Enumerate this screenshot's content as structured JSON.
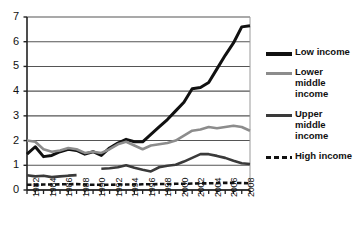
{
  "chart_data": {
    "type": "line",
    "title": "",
    "xlabel": "",
    "ylabel": "",
    "xlim": [
      1982,
      2009
    ],
    "ylim": [
      0,
      7
    ],
    "yticks": [
      0,
      1,
      2,
      3,
      4,
      5,
      6,
      7
    ],
    "xticks": [
      1982,
      1983,
      1984,
      1985,
      1986,
      1987,
      1988,
      1989,
      1990,
      1991,
      1992,
      1993,
      1994,
      1995,
      1996,
      1997,
      1998,
      1999,
      2000,
      2001,
      2002,
      2003,
      2004,
      2005,
      2006,
      2007,
      2008,
      2009
    ],
    "xtick_labels": [
      "1982",
      "1984",
      "1986",
      "1988",
      "1990",
      "1992",
      "1994",
      "1996",
      "1998",
      "2000",
      "2002",
      "2004",
      "2006",
      "2008"
    ],
    "xtick_label_years": [
      1982,
      1984,
      1986,
      1988,
      1990,
      1992,
      1994,
      1996,
      1998,
      2000,
      2002,
      2004,
      2006,
      2008
    ],
    "grid": "horizontal",
    "legend_position": "right",
    "series": [
      {
        "name": "Low income",
        "color": "#111111",
        "width": 3.0,
        "dash": "none",
        "x": [
          1982,
          1983,
          1984,
          1985,
          1986,
          1987,
          1988,
          1989,
          1990,
          1991,
          1992,
          1993,
          1994,
          1995,
          1996,
          1997,
          1998,
          1999,
          2000,
          2001,
          2002,
          2003,
          2004,
          2005,
          2006,
          2007,
          2008,
          2009
        ],
        "values": [
          1.45,
          1.75,
          1.35,
          1.4,
          1.55,
          1.65,
          1.6,
          1.45,
          1.55,
          1.4,
          1.7,
          1.9,
          2.05,
          1.95,
          1.95,
          2.25,
          2.55,
          2.85,
          3.2,
          3.55,
          4.1,
          4.15,
          4.35,
          4.9,
          5.45,
          5.95,
          6.6,
          6.65
        ]
      },
      {
        "name": "Lower middle income",
        "color": "#8c8c8c",
        "width": 2.6,
        "dash": "none",
        "x": [
          1982,
          1983,
          1984,
          1985,
          1986,
          1987,
          1988,
          1989,
          1990,
          1991,
          1992,
          1993,
          1994,
          1995,
          1996,
          1997,
          1998,
          1999,
          2000,
          2001,
          2002,
          2003,
          2004,
          2005,
          2006,
          2007,
          2008,
          2009
        ],
        "values": [
          2.0,
          1.95,
          1.65,
          1.55,
          1.6,
          1.7,
          1.65,
          1.5,
          1.55,
          1.5,
          1.65,
          1.85,
          1.95,
          1.8,
          1.65,
          1.8,
          1.85,
          1.9,
          2.0,
          2.2,
          2.4,
          2.45,
          2.55,
          2.5,
          2.55,
          2.6,
          2.55,
          2.4
        ]
      },
      {
        "name": "Upper middle income",
        "color": "#3a3a3a",
        "width": 2.6,
        "dash": "none",
        "x": [
          1982,
          1983,
          1984,
          1985,
          1986,
          1987,
          1988,
          1991,
          1992,
          1993,
          1994,
          1995,
          1996,
          1997,
          1998,
          1999,
          2000,
          2001,
          2002,
          2003,
          2004,
          2005,
          2006,
          2007,
          2008,
          2009
        ],
        "values": [
          0.6,
          0.55,
          0.58,
          0.52,
          0.55,
          0.58,
          0.6,
          0.86,
          0.88,
          0.92,
          1.0,
          0.9,
          0.82,
          0.75,
          0.92,
          0.98,
          1.02,
          1.15,
          1.3,
          1.45,
          1.45,
          1.38,
          1.3,
          1.18,
          1.08,
          1.05
        ],
        "segments": [
          [
            1982,
            1988
          ],
          [
            1991,
            2009
          ]
        ]
      },
      {
        "name": "High income",
        "color": "#111111",
        "width": 2.6,
        "dash": "dashed",
        "x": [
          1982,
          1983,
          1984,
          1985,
          1986,
          1987,
          1988,
          1989,
          1990,
          1991,
          1992,
          1993,
          1994,
          1995,
          1996,
          1997,
          1998,
          1999,
          2000,
          2001,
          2002,
          2003,
          2004,
          2005,
          2006,
          2007,
          2008,
          2009
        ],
        "values": [
          0.21,
          0.21,
          0.22,
          0.22,
          0.23,
          0.23,
          0.24,
          0.22,
          0.21,
          0.21,
          0.21,
          0.22,
          0.22,
          0.22,
          0.23,
          0.23,
          0.24,
          0.24,
          0.25,
          0.25,
          0.26,
          0.27,
          0.27,
          0.28,
          0.29,
          0.29,
          0.28,
          0.27
        ]
      }
    ],
    "legend_entries": [
      {
        "label": "Low income",
        "color": "#111111",
        "dash": "none",
        "thickness": 4
      },
      {
        "label": "Lower middle income",
        "color": "#8c8c8c",
        "dash": "none",
        "thickness": 3
      },
      {
        "label": "Upper middle income",
        "color": "#3a3a3a",
        "dash": "none",
        "thickness": 3
      },
      {
        "label": "High income",
        "color": "#111111",
        "dash": "dashed",
        "thickness": 3
      }
    ]
  },
  "axes": {
    "ytick_labels": [
      "7",
      "6",
      "5",
      "4",
      "3",
      "2",
      "1",
      "0"
    ]
  }
}
